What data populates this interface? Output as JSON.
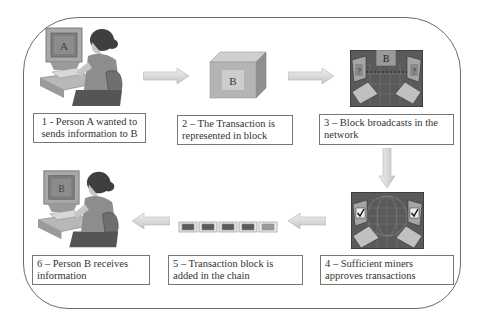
{
  "diagram": {
    "steps": [
      {
        "id": 1,
        "label": "1 - Person A wanted to sends information to B",
        "line1": "1 - Person A wanted to",
        "line2": "sends information to B",
        "icon": "person-at-computer-icon",
        "screen_letter": "A"
      },
      {
        "id": 2,
        "label": "2 – The Transaction is represented in block",
        "line1": "2 – The Transaction is",
        "line2": "represented in block",
        "icon": "block-cube-icon",
        "block_letter": "B"
      },
      {
        "id": 3,
        "label": "3 – Block broadcasts in the network",
        "line1": "3 – Block broadcasts in the",
        "line2": "network",
        "icon": "network-broadcast-icon",
        "block_letter": "B",
        "node_mark": "?"
      },
      {
        "id": 4,
        "label": "4 – Sufficient miners approves transactions",
        "line1": "4 – Sufficient miners",
        "line2": "approves transactions",
        "icon": "network-approval-icon",
        "node_mark": "✔"
      },
      {
        "id": 5,
        "label": "5 – Transaction block is added in the chain",
        "line1": "5 – Transaction block is",
        "line2": "added in the chain",
        "icon": "block-chain-icon",
        "chain_blocks": 5
      },
      {
        "id": 6,
        "label": "6 – Person B receives information",
        "line1": "6 – Person B receives",
        "line2": "information",
        "icon": "person-at-computer-icon",
        "screen_letter": "B"
      }
    ],
    "flow": [
      "1→2",
      "2→3",
      "3→4",
      "4→5",
      "5→6"
    ],
    "colors": {
      "frame": "#6b6b6b",
      "label_border": "#777777",
      "arrow_fill": "#d8d8d8",
      "arrow_stroke": "#b5b5b5",
      "figure_dark": "#4a4a4a",
      "figure_mid": "#8a8a8a",
      "figure_light": "#c8c8c8"
    }
  }
}
